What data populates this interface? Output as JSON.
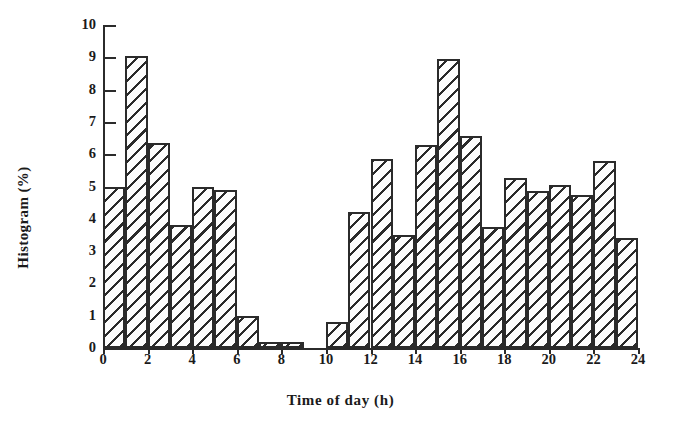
{
  "chart_data": {
    "type": "bar",
    "title": "",
    "xlabel": "Time of day (h)",
    "ylabel": "Histogram (%)",
    "xlim": [
      0,
      24
    ],
    "ylim": [
      0,
      10
    ],
    "grid": false,
    "legend": null,
    "x_tick_labels": [
      "0",
      "2",
      "4",
      "6",
      "8",
      "10",
      "12",
      "14",
      "16",
      "18",
      "20",
      "22",
      "24"
    ],
    "x_tick_values": [
      0,
      2,
      4,
      6,
      8,
      10,
      12,
      14,
      16,
      18,
      20,
      22,
      24
    ],
    "y_tick_labels": [
      "0",
      "1",
      "2",
      "3",
      "4",
      "5",
      "6",
      "7",
      "8",
      "9",
      "10"
    ],
    "y_tick_values": [
      0,
      1,
      2,
      3,
      4,
      5,
      6,
      7,
      8,
      9,
      10
    ],
    "bin_width": 1,
    "bin_edges": [
      0,
      1,
      2,
      3,
      4,
      5,
      6,
      7,
      8,
      9,
      10,
      11,
      12,
      13,
      14,
      15,
      16,
      17,
      18,
      19,
      20,
      21,
      22,
      23,
      24
    ],
    "categories": [
      "0-1",
      "1-2",
      "2-3",
      "3-4",
      "4-5",
      "5-6",
      "6-7",
      "7-8",
      "8-9",
      "9-10",
      "10-11",
      "11-12",
      "12-13",
      "13-14",
      "14-15",
      "15-16",
      "16-17",
      "17-18",
      "18-19",
      "19-20",
      "20-21",
      "21-22",
      "22-23",
      "23-24"
    ],
    "values": [
      5.0,
      9.05,
      6.35,
      3.8,
      5.0,
      4.9,
      1.0,
      0.2,
      0.2,
      0.0,
      0.8,
      4.2,
      5.85,
      3.5,
      6.3,
      8.95,
      6.55,
      3.75,
      5.25,
      4.85,
      5.05,
      4.75,
      5.8,
      3.4
    ],
    "bar_style": {
      "fill": "#fdfdfd",
      "hatch": "diagonal-45",
      "edge_color": "#2b2b2b",
      "edge_width": 2
    }
  },
  "axes": {
    "x_title": "Time of day (h)",
    "y_title": "Histogram (%)"
  }
}
